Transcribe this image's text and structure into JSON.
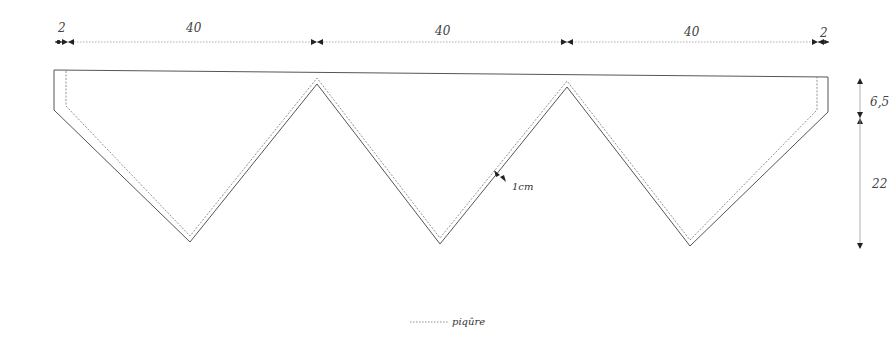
{
  "diagram": {
    "type": "sewing-pattern",
    "dimensions": {
      "top": [
        {
          "id": "margin-left",
          "label": "2"
        },
        {
          "id": "segment-1",
          "label": "40"
        },
        {
          "id": "segment-2",
          "label": "40"
        },
        {
          "id": "segment-3",
          "label": "40"
        },
        {
          "id": "margin-right",
          "label": "2"
        }
      ],
      "right": [
        {
          "id": "band-height",
          "label": "6,5"
        },
        {
          "id": "point-height",
          "label": "22"
        }
      ],
      "seam_allowance": {
        "label": "1cm"
      }
    },
    "legend": {
      "stitch_label": "piqûre"
    },
    "colors": {
      "outline": "#555555",
      "stitch": "#777777",
      "dimension": "#999999",
      "arrow": "#222222"
    }
  }
}
